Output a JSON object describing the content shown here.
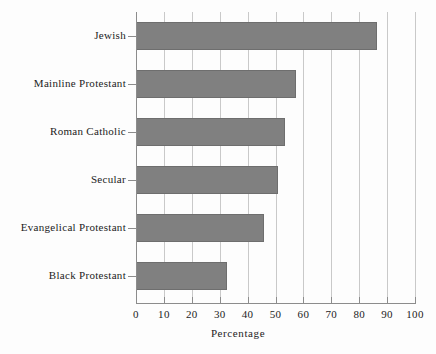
{
  "chart_data": {
    "type": "bar",
    "orientation": "horizontal",
    "title": "",
    "xlabel": "Percentage",
    "ylabel": "",
    "categories": [
      "Jewish",
      "Mainline Protestant",
      "Roman Catholic",
      "Secular",
      "Evangelical Protestant",
      "Black Protestant"
    ],
    "values": [
      86.5,
      57.5,
      53.5,
      51,
      46,
      32.5
    ],
    "xlim": [
      0,
      100
    ],
    "xticks": [
      0,
      10,
      20,
      30,
      40,
      50,
      60,
      70,
      80,
      90,
      100
    ],
    "xtick_labels": [
      "0",
      "10",
      "20",
      "30",
      "40",
      "50",
      "60",
      "70",
      "80",
      "90",
      "100"
    ],
    "grid": "vertical",
    "legend": null,
    "bar_color": "#808080",
    "gridline_color": "#c9c9c9",
    "axis_color": "#8c8c8c",
    "background_color": "#fdfdfd"
  }
}
